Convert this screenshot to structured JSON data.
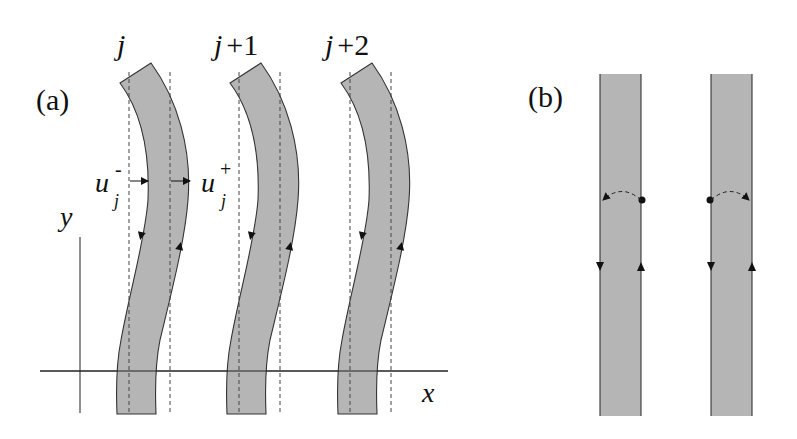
{
  "figure": {
    "panel_a": {
      "label": "(a)",
      "strip_labels": [
        "j",
        "j+1",
        "j+2"
      ],
      "strip_label_parts": [
        {
          "var": "j",
          "suffix": ""
        },
        {
          "var": "j",
          "suffix": "+1"
        },
        {
          "var": "j",
          "suffix": "+2"
        }
      ],
      "displacement_labels": {
        "left": {
          "base": "u",
          "sub": "j",
          "sup": "-"
        },
        "right": {
          "base": "u",
          "sub": "j",
          "sup": "+"
        }
      },
      "axes": {
        "x_label": "x",
        "y_label": "y"
      }
    },
    "panel_b": {
      "label": "(b)"
    },
    "colors": {
      "strip_fill": "#b5b5b5",
      "stroke": "#333333",
      "background": "#ffffff"
    }
  }
}
